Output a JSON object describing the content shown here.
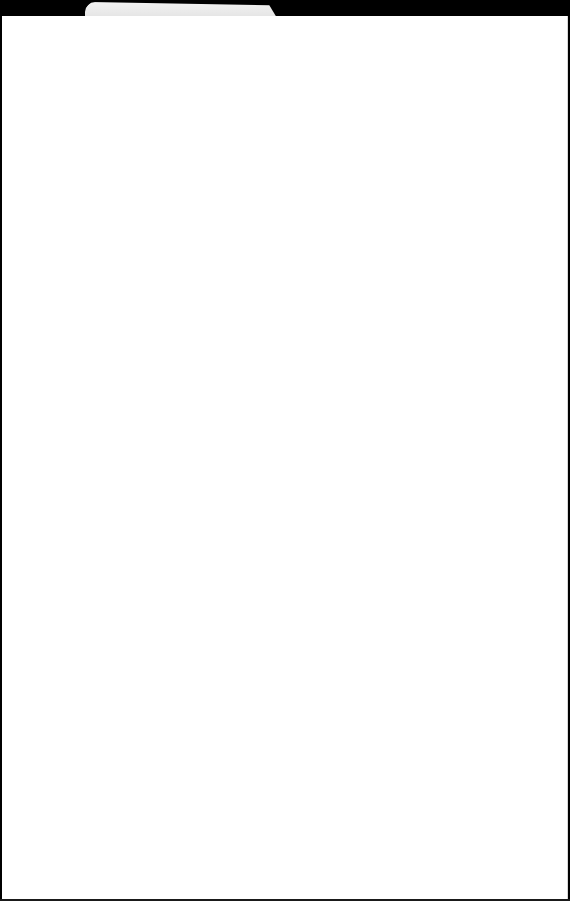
{
  "window": {
    "tab": {
      "title": ""
    },
    "content": {
      "text": ""
    }
  },
  "colors": {
    "chrome": "#000000",
    "tab": "#eeeeee",
    "page_background": "#ffffff"
  }
}
